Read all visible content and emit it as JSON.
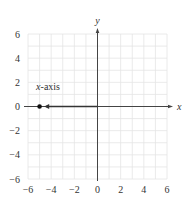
{
  "chart_data": {
    "type": "line",
    "title": "",
    "xlabel": "x",
    "ylabel": "y",
    "xlim": [
      -6,
      6
    ],
    "ylim": [
      -6,
      6
    ],
    "grid": true,
    "grid_minor_step": 1,
    "x_ticks": [
      -6,
      -4,
      -2,
      0,
      2,
      4,
      6
    ],
    "y_ticks": [
      -6,
      -4,
      -2,
      0,
      2,
      4,
      6
    ],
    "x_tick_labels": [
      "−6",
      "−4",
      "−2",
      "0",
      "2",
      "4",
      "6"
    ],
    "y_tick_labels": [
      "−6",
      "−4",
      "−2",
      "0",
      "2",
      "4",
      "6"
    ],
    "series": [
      {
        "name": "arrow along x-axis",
        "points": [
          [
            0,
            0
          ],
          [
            -4.6,
            0
          ]
        ],
        "arrowhead": "end"
      }
    ],
    "points": [
      {
        "x": -5,
        "y": 0,
        "style": "filled-dot"
      }
    ],
    "annotations": [
      {
        "text_italic": "x",
        "text_rest": "-axis",
        "x": -5.3,
        "y": 1.4
      }
    ],
    "colors": {
      "axis": "#444444",
      "grid": "#e4e4e4",
      "arrow": "#333333",
      "dot": "#111111"
    }
  }
}
